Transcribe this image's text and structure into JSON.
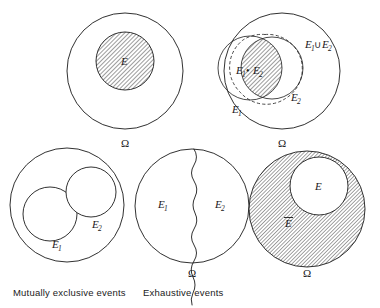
{
  "figure": {
    "background_color": "#ffffff",
    "ink_color": "#1a1a1a",
    "hatch_color": "#555555",
    "panels": [
      {
        "id": "event-E",
        "position": "top-left",
        "description": "Sample space circle containing one shaded event circle",
        "sample_space_label": "Ω",
        "region_labels": [
          {
            "name": "event-E-label",
            "text": "E",
            "subscript": "",
            "shaded": true
          }
        ]
      },
      {
        "id": "union-intersection",
        "position": "top-right",
        "description": "Sample space circle containing two overlapping event circles; intersection shaded, union outlined with dashed curve",
        "sample_space_label": "Ω",
        "region_labels": [
          {
            "name": "intersection-label",
            "text": "E",
            "subscript": "1",
            "operator": "•",
            "text2": "E",
            "subscript2": "2",
            "shaded": true
          },
          {
            "name": "union-label",
            "text": "E",
            "subscript": "1",
            "operator": "∪",
            "text2": "E",
            "subscript2": "2",
            "shaded": false
          },
          {
            "name": "event-E1-label",
            "text": "E",
            "subscript": "1",
            "shaded": false
          },
          {
            "name": "event-E2-label",
            "text": "E",
            "subscript": "2",
            "shaded": false
          }
        ]
      },
      {
        "id": "mutually-exclusive",
        "position": "bottom-left",
        "description": "Sample space circle containing two disjoint event circles",
        "sample_space_label": "",
        "caption": "Mutually exclusive events",
        "region_labels": [
          {
            "name": "event-E1-label",
            "text": "E",
            "subscript": "1",
            "shaded": false
          },
          {
            "name": "event-E2-label",
            "text": "E",
            "subscript": "2",
            "shaded": false
          }
        ]
      },
      {
        "id": "exhaustive",
        "position": "bottom-center",
        "description": "Sample space circle split by a wavy line into two exhaustive events",
        "sample_space_label": "Ω",
        "caption": "Exhaustive events",
        "region_labels": [
          {
            "name": "event-E1-label",
            "text": "E",
            "subscript": "1",
            "shaded": false
          },
          {
            "name": "event-E2-label",
            "text": "E",
            "subscript": "2",
            "shaded": false
          }
        ]
      },
      {
        "id": "complement",
        "position": "bottom-right",
        "description": "Sample space circle fully shaded except an unshaded inner event circle; shaded annulus is the complement",
        "sample_space_label": "Ω",
        "region_labels": [
          {
            "name": "event-E-label",
            "text": "E",
            "subscript": "",
            "shaded": false
          },
          {
            "name": "complement-E-label",
            "text": "E",
            "subscript": "",
            "overbar": true,
            "shaded": true
          }
        ]
      }
    ]
  },
  "labels": {
    "omega": "Ω",
    "E": "E",
    "sub1": "1",
    "sub2": "2",
    "dot_operator": "•",
    "union_operator": "∪"
  },
  "captions": {
    "mutually_exclusive": "Mutually exclusive events",
    "exhaustive": "Exhaustive events"
  }
}
